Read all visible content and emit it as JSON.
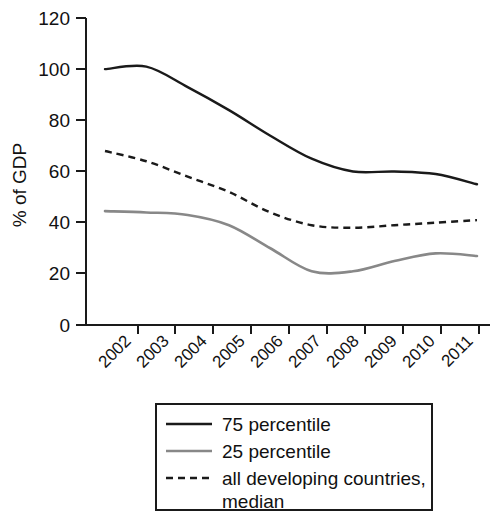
{
  "chart_data": {
    "type": "line",
    "title": "",
    "xlabel": "",
    "ylabel": "% of GDP",
    "categories": [
      "2002",
      "2003",
      "2004",
      "2005",
      "2006",
      "2007",
      "2008",
      "2009",
      "2010",
      "2011"
    ],
    "x": [
      2002,
      2003,
      2004,
      2005,
      2006,
      2007,
      2008,
      2009,
      2010,
      2011
    ],
    "ylim": [
      0,
      120
    ],
    "yticks": [
      0,
      20,
      40,
      60,
      80,
      100,
      120
    ],
    "ytick_labels": [
      "0",
      "20",
      "40",
      "60",
      "80",
      "100",
      "120"
    ],
    "xtick_labels": [
      "2002",
      "2003",
      "2004",
      "2005",
      "2006",
      "2007",
      "2008",
      "2009",
      "2010",
      "2011"
    ],
    "grid": false,
    "legend_position": "below",
    "series": [
      {
        "name": "75 percentile",
        "style": "solid",
        "color": "#1a1a1a",
        "values": [
          100,
          101,
          93,
          84,
          74,
          65,
          60,
          60,
          59,
          55
        ]
      },
      {
        "name": "25 percentile",
        "style": "solid",
        "color": "#888888",
        "values": [
          44.5,
          44,
          43,
          39,
          30,
          21,
          21,
          25,
          28,
          27
        ]
      },
      {
        "name": "all developing countries, median",
        "style": "dashed",
        "color": "#1a1a1a",
        "values": [
          68,
          64,
          58,
          52,
          44,
          39,
          38,
          39,
          40,
          41
        ]
      }
    ]
  },
  "axes": {
    "y_title": "% of GDP",
    "y_tick_0": "0",
    "y_tick_1": "20",
    "y_tick_2": "40",
    "y_tick_3": "60",
    "y_tick_4": "80",
    "y_tick_5": "100",
    "y_tick_6": "120",
    "x_tick_0": "2002",
    "x_tick_1": "2003",
    "x_tick_2": "2004",
    "x_tick_3": "2005",
    "x_tick_4": "2006",
    "x_tick_5": "2007",
    "x_tick_6": "2008",
    "x_tick_7": "2009",
    "x_tick_8": "2010",
    "x_tick_9": "2011"
  },
  "legend": {
    "item_0": "75 percentile",
    "item_1": "25 percentile",
    "item_2": "all developing countries,",
    "item_2_cont": "median"
  },
  "colors": {
    "series_dark": "#1a1a1a",
    "series_gray": "#888888",
    "axis": "#1a1a1a",
    "background": "#ffffff"
  }
}
